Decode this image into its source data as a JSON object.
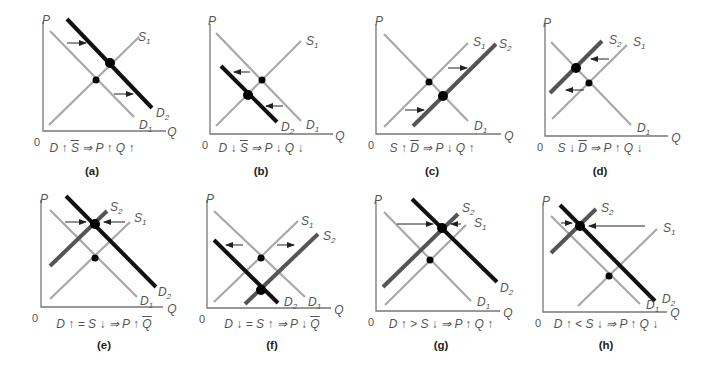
{
  "figure": {
    "line_colors": {
      "original_curve": "#a8a8a8",
      "shifted_supply": "#555555",
      "shifted_demand": "#111111",
      "axis": "#777777",
      "arrow": "#222222"
    },
    "axis_labels": {
      "y": "P",
      "x": "Q",
      "origin": "0"
    },
    "panels": [
      {
        "id": "a",
        "label": "(a)",
        "caption": [
          {
            "t": "D "
          },
          {
            "t": "↑ "
          },
          {
            "t": "S",
            "ov": true
          },
          {
            "t": " ⇒ P "
          },
          {
            "t": "↑"
          },
          {
            "t": " Q "
          },
          {
            "t": "↑"
          }
        ],
        "caption_text": "D ↑ S̄ ⇒ P ↑ Q ↑",
        "axes": {
          "ox": 43,
          "oy": 131,
          "xend": 166,
          "ytop": 22
        },
        "labels": {
          "P": [
            46,
            24
          ],
          "Q": [
            172,
            136
          ],
          "O": [
            37,
            146
          ]
        },
        "curves": [
          {
            "name": "D1",
            "kind": "orig",
            "x1": 50,
            "y1": 31,
            "x2": 134,
            "y2": 117,
            "label": "D",
            "sub": "1",
            "lx": 139,
            "ly": 129
          },
          {
            "name": "S1",
            "kind": "orig",
            "x1": 49,
            "y1": 125,
            "x2": 139,
            "y2": 37,
            "label": "S",
            "sub": "1",
            "lx": 138,
            "ly": 41
          },
          {
            "name": "D2",
            "kind": "newD",
            "x1": 67,
            "y1": 19,
            "x2": 152,
            "y2": 108,
            "label": "D",
            "sub": "2",
            "lx": 156,
            "ly": 117
          }
        ],
        "points": [
          {
            "x": 96,
            "y": 80,
            "r": 3.5
          },
          {
            "x": 110,
            "y": 63,
            "r": 5
          }
        ],
        "arrows": [
          {
            "x1": 67,
            "y1": 43,
            "x2": 86,
            "y2": 43
          },
          {
            "x1": 114,
            "y1": 94,
            "x2": 133,
            "y2": 94
          }
        ]
      },
      {
        "id": "b",
        "label": "(b)",
        "caption": [
          {
            "t": "D "
          },
          {
            "t": "↓ "
          },
          {
            "t": "S",
            "ov": true
          },
          {
            "t": " ⇒ P "
          },
          {
            "t": "↓"
          },
          {
            "t": " Q "
          },
          {
            "t": "↓"
          }
        ],
        "caption_text": "D ↓ S̄ ⇒ P ↓ Q ↓",
        "axes": {
          "ox": 210,
          "oy": 134,
          "xend": 333,
          "ytop": 24
        },
        "labels": {
          "P": [
            212,
            25
          ],
          "Q": [
            340,
            140
          ],
          "O": [
            205,
            149
          ]
        },
        "curves": [
          {
            "name": "D1",
            "kind": "orig",
            "x1": 216,
            "y1": 33,
            "x2": 301,
            "y2": 121,
            "label": "D",
            "sub": "1",
            "lx": 306,
            "ly": 129
          },
          {
            "name": "S1",
            "kind": "orig",
            "x1": 216,
            "y1": 126,
            "x2": 301,
            "y2": 41,
            "label": "S",
            "sub": "1",
            "lx": 306,
            "ly": 45
          },
          {
            "name": "D2",
            "kind": "newD",
            "x1": 221,
            "y1": 66,
            "x2": 277,
            "y2": 122,
            "label": "D",
            "sub": "2",
            "lx": 281,
            "ly": 131
          }
        ],
        "points": [
          {
            "x": 262,
            "y": 80,
            "r": 3.5
          },
          {
            "x": 248,
            "y": 95,
            "r": 5
          }
        ],
        "arrows": [
          {
            "x1": 250,
            "y1": 72,
            "x2": 234,
            "y2": 72
          },
          {
            "x1": 283,
            "y1": 106,
            "x2": 266,
            "y2": 106
          }
        ]
      },
      {
        "id": "c",
        "label": "(c)",
        "caption": [
          {
            "t": "S "
          },
          {
            "t": "↑ "
          },
          {
            "t": "D",
            "ov": true
          },
          {
            "t": " ⇒ P "
          },
          {
            "t": "↓"
          },
          {
            "t": " Q "
          },
          {
            "t": "↑"
          }
        ],
        "caption_text": "S ↑ D̄ ⇒ P ↓ Q ↑",
        "axes": {
          "ox": 376,
          "oy": 134,
          "xend": 501,
          "ytop": 24
        },
        "labels": {
          "P": [
            379,
            25
          ],
          "Q": [
            509,
            140
          ],
          "O": [
            371,
            149
          ]
        },
        "curves": [
          {
            "name": "D1",
            "kind": "orig",
            "x1": 384,
            "y1": 34,
            "x2": 468,
            "y2": 121,
            "label": "D",
            "sub": "1",
            "lx": 474,
            "ly": 130
          },
          {
            "name": "S1",
            "kind": "orig",
            "x1": 384,
            "y1": 127,
            "x2": 468,
            "y2": 43,
            "label": "S",
            "sub": "1",
            "lx": 473,
            "ly": 46
          },
          {
            "name": "S2",
            "kind": "newS",
            "x1": 413,
            "y1": 126,
            "x2": 496,
            "y2": 44,
            "label": "S",
            "sub": "2",
            "lx": 499,
            "ly": 48
          }
        ],
        "points": [
          {
            "x": 429,
            "y": 82,
            "r": 3.5
          },
          {
            "x": 443,
            "y": 96,
            "r": 5
          }
        ],
        "arrows": [
          {
            "x1": 448,
            "y1": 68,
            "x2": 467,
            "y2": 68
          },
          {
            "x1": 405,
            "y1": 110,
            "x2": 424,
            "y2": 110
          }
        ]
      },
      {
        "id": "d",
        "label": "(d)",
        "caption": [
          {
            "t": "S "
          },
          {
            "t": "↓ "
          },
          {
            "t": "D",
            "ov": true
          },
          {
            "t": " ⇒ P "
          },
          {
            "t": "↑"
          },
          {
            "t": " Q "
          },
          {
            "t": "↓"
          }
        ],
        "caption_text": "S ↓ D̄ ⇒ P ↑ Q ↓",
        "axes": {
          "ox": 545,
          "oy": 136,
          "xend": 668,
          "ytop": 24
        },
        "labels": {
          "P": [
            547,
            27
          ],
          "Q": [
            676,
            142
          ],
          "O": [
            540,
            151
          ]
        },
        "curves": [
          {
            "name": "D1",
            "kind": "orig",
            "x1": 551,
            "y1": 42,
            "x2": 631,
            "y2": 125,
            "label": "D",
            "sub": "1",
            "lx": 637,
            "ly": 132
          },
          {
            "name": "S1",
            "kind": "orig",
            "x1": 552,
            "y1": 119,
            "x2": 627,
            "y2": 45,
            "label": "S",
            "sub": "1",
            "lx": 633,
            "ly": 46
          },
          {
            "name": "S2",
            "kind": "newS",
            "x1": 550,
            "y1": 93,
            "x2": 602,
            "y2": 41,
            "label": "S",
            "sub": "2",
            "lx": 609,
            "ly": 44
          }
        ],
        "points": [
          {
            "x": 589,
            "y": 83,
            "r": 3.5
          },
          {
            "x": 576,
            "y": 68,
            "r": 5
          }
        ],
        "arrows": [
          {
            "x1": 609,
            "y1": 59,
            "x2": 591,
            "y2": 59
          },
          {
            "x1": 584,
            "y1": 90,
            "x2": 566,
            "y2": 90
          }
        ]
      },
      {
        "id": "e",
        "label": "(e)",
        "caption": [
          {
            "t": "D "
          },
          {
            "t": "↑"
          },
          {
            "t": " = S "
          },
          {
            "t": "↓"
          },
          {
            "t": " ⇒ P "
          },
          {
            "t": "↑ "
          },
          {
            "t": "Q",
            "ov": true
          }
        ],
        "caption_text": "D ↑ = S ↓ ⇒ P ↑ Q̄",
        "axes": {
          "ox": 41,
          "oy": 307,
          "xend": 163,
          "ytop": 200
        },
        "labels": {
          "P": [
            44,
            203
          ],
          "Q": [
            172,
            313
          ],
          "O": [
            35,
            322
          ]
        },
        "curves": [
          {
            "name": "D1",
            "kind": "orig",
            "x1": 50,
            "y1": 210,
            "x2": 137,
            "y2": 297,
            "label": "D",
            "sub": "1",
            "lx": 140,
            "ly": 305
          },
          {
            "name": "S1",
            "kind": "orig",
            "x1": 50,
            "y1": 299,
            "x2": 130,
            "y2": 222,
            "label": "S",
            "sub": "1",
            "lx": 134,
            "ly": 222
          },
          {
            "name": "S2",
            "kind": "newS",
            "x1": 50,
            "y1": 266,
            "x2": 107,
            "y2": 211,
            "label": "S",
            "sub": "2",
            "lx": 110,
            "ly": 211
          },
          {
            "name": "D2",
            "kind": "newD",
            "x1": 66,
            "y1": 196,
            "x2": 156,
            "y2": 287,
            "label": "D",
            "sub": "2",
            "lx": 158,
            "ly": 296
          }
        ],
        "points": [
          {
            "x": 95,
            "y": 258,
            "r": 3.5
          },
          {
            "x": 95,
            "y": 224,
            "r": 5
          }
        ],
        "arrows": [
          {
            "x1": 65,
            "y1": 222,
            "x2": 86,
            "y2": 222
          },
          {
            "x1": 125,
            "y1": 222,
            "x2": 104,
            "y2": 222
          }
        ]
      },
      {
        "id": "f",
        "label": "(f)",
        "caption": [
          {
            "t": "D "
          },
          {
            "t": "↓"
          },
          {
            "t": " = S "
          },
          {
            "t": "↑"
          },
          {
            "t": " ⇒ P "
          },
          {
            "t": "↓ "
          },
          {
            "t": "Q",
            "ov": true
          }
        ],
        "caption_text": "D ↓ = S ↑ ⇒ P ↓ Q̄",
        "axes": {
          "ox": 207,
          "oy": 308,
          "xend": 331,
          "ytop": 200
        },
        "labels": {
          "P": [
            210,
            203
          ],
          "Q": [
            339,
            314
          ],
          "O": [
            202,
            323
          ]
        },
        "curves": [
          {
            "name": "D1",
            "kind": "orig",
            "x1": 214,
            "y1": 211,
            "x2": 305,
            "y2": 297,
            "label": "D",
            "sub": "1",
            "lx": 308,
            "ly": 306
          },
          {
            "name": "S1",
            "kind": "orig",
            "x1": 214,
            "y1": 302,
            "x2": 298,
            "y2": 221,
            "label": "S",
            "sub": "1",
            "lx": 301,
            "ly": 225
          },
          {
            "name": "D2",
            "kind": "newD",
            "x1": 214,
            "y1": 240,
            "x2": 278,
            "y2": 303,
            "label": "D",
            "sub": "2",
            "lx": 284,
            "ly": 306
          },
          {
            "name": "S2",
            "kind": "newS",
            "x1": 245,
            "y1": 304,
            "x2": 318,
            "y2": 234,
            "label": "S",
            "sub": "2",
            "lx": 323,
            "ly": 240
          }
        ],
        "points": [
          {
            "x": 261,
            "y": 258,
            "r": 3.5
          },
          {
            "x": 261,
            "y": 290,
            "r": 5
          }
        ],
        "arrows": [
          {
            "x1": 243,
            "y1": 245,
            "x2": 226,
            "y2": 245
          },
          {
            "x1": 277,
            "y1": 245,
            "x2": 294,
            "y2": 245
          }
        ]
      },
      {
        "id": "g",
        "label": "(g)",
        "caption": [
          {
            "t": "D "
          },
          {
            "t": "↑"
          },
          {
            "t": " > S "
          },
          {
            "t": "↓"
          },
          {
            "t": " ⇒ P "
          },
          {
            "t": "↑"
          },
          {
            "t": " Q "
          },
          {
            "t": "↑"
          }
        ],
        "caption_text": "D ↑ > S ↓ ⇒ P ↑ Q ↑",
        "axes": {
          "ox": 376,
          "oy": 311,
          "xend": 500,
          "ytop": 202
        },
        "labels": {
          "P": [
            378,
            204
          ],
          "Q": [
            508,
            317
          ],
          "O": [
            371,
            326
          ]
        },
        "curves": [
          {
            "name": "D1",
            "kind": "orig",
            "x1": 384,
            "y1": 212,
            "x2": 471,
            "y2": 301,
            "label": "D",
            "sub": "1",
            "lx": 477,
            "ly": 306
          },
          {
            "name": "S1",
            "kind": "orig",
            "x1": 385,
            "y1": 305,
            "x2": 466,
            "y2": 225,
            "label": "S",
            "sub": "1",
            "lx": 474,
            "ly": 227
          },
          {
            "name": "S2",
            "kind": "newS",
            "x1": 383,
            "y1": 287,
            "x2": 458,
            "y2": 214,
            "label": "S",
            "sub": "2",
            "lx": 462,
            "ly": 212
          },
          {
            "name": "D2",
            "kind": "newD",
            "x1": 412,
            "y1": 199,
            "x2": 497,
            "y2": 282,
            "label": "D",
            "sub": "2",
            "lx": 500,
            "ly": 292
          }
        ],
        "points": [
          {
            "x": 430,
            "y": 260,
            "r": 3.5
          },
          {
            "x": 442,
            "y": 228,
            "r": 5
          }
        ],
        "arrows": [
          {
            "x1": 397,
            "y1": 224,
            "x2": 433,
            "y2": 224
          },
          {
            "x1": 461,
            "y1": 224,
            "x2": 451,
            "y2": 224
          }
        ]
      },
      {
        "id": "h",
        "label": "(h)",
        "caption": [
          {
            "t": "D "
          },
          {
            "t": "↑"
          },
          {
            "t": " < S "
          },
          {
            "t": "↓"
          },
          {
            "t": " ⇒ P "
          },
          {
            "t": "↑"
          },
          {
            "t": " Q "
          },
          {
            "t": "↓"
          }
        ],
        "caption_text": "D ↑ < S ↓ ⇒ P ↑ Q ↓",
        "axes": {
          "ox": 543,
          "oy": 312,
          "xend": 667,
          "ytop": 204
        },
        "labels": {
          "P": [
            546,
            205
          ],
          "Q": [
            675,
            317
          ],
          "O": [
            538,
            327
          ]
        },
        "curves": [
          {
            "name": "D1",
            "kind": "orig",
            "x1": 551,
            "y1": 216,
            "x2": 640,
            "y2": 304,
            "label": "D",
            "sub": "1",
            "lx": 646,
            "ly": 309
          },
          {
            "name": "S1",
            "kind": "orig",
            "x1": 578,
            "y1": 306,
            "x2": 657,
            "y2": 229,
            "label": "S",
            "sub": "1",
            "lx": 663,
            "ly": 232
          },
          {
            "name": "S2",
            "kind": "newS",
            "x1": 551,
            "y1": 253,
            "x2": 596,
            "y2": 209,
            "label": "S",
            "sub": "2",
            "lx": 601,
            "ly": 212
          },
          {
            "name": "D2",
            "kind": "newD",
            "x1": 560,
            "y1": 205,
            "x2": 655,
            "y2": 301,
            "label": "D",
            "sub": "2",
            "lx": 662,
            "ly": 303
          }
        ],
        "points": [
          {
            "x": 609,
            "y": 276,
            "r": 3.5
          },
          {
            "x": 580,
            "y": 226,
            "r": 5
          }
        ],
        "arrows": [
          {
            "x1": 561,
            "y1": 223,
            "x2": 572,
            "y2": 223
          },
          {
            "x1": 645,
            "y1": 226,
            "x2": 589,
            "y2": 226
          }
        ]
      }
    ],
    "caption_positions": {
      "top_row": {
        "caption_y": 149,
        "label_y": 172,
        "centers": [
          92,
          261,
          432,
          600
        ]
      },
      "bottom_row": {
        "caption_y": 325,
        "label_y": 346,
        "centers": [
          104,
          272,
          441,
          606
        ]
      }
    }
  }
}
